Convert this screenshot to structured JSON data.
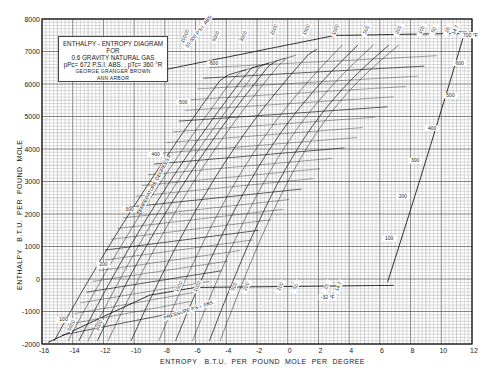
{
  "chart_data": {
    "type": "line",
    "subtitle": "pPc = 672 P.S.I. ABS. , pTc = 360 °R",
    "author": "GEORGE GRANGER BROWN",
    "institution": "ANN ARBOR",
    "xlabel": "ENTROPY   B.T.U.  PER  POUND  MOLE  PER  DEGREE",
    "ylabel": "ENTHALPY   B.T.U.  PER  POUND  MOLE",
    "xlim": [
      -16,
      12
    ],
    "ylim": [
      -2000,
      8000
    ],
    "x_ticks": [
      -16,
      -14,
      -12,
      -10,
      -8,
      -6,
      -4,
      -2,
      0,
      2,
      4,
      6,
      8,
      10,
      12
    ],
    "x_tick_labels": [
      "-16",
      "-14",
      "-12",
      "-10",
      "-8",
      "-6",
      "-4",
      "-2",
      "0",
      "2",
      "4",
      "6",
      "8",
      "10",
      "12"
    ],
    "y_ticks": [
      8000,
      7000,
      6000,
      5000,
      4000,
      3000,
      2000,
      1000,
      0,
      -1000,
      -2000
    ],
    "y_tick_labels": [
      "8000",
      "7000",
      "6000",
      "5000",
      "4000",
      "3000",
      "2000",
      "1000",
      "0",
      "-1000",
      "-2000"
    ],
    "grid": true,
    "annotations": {
      "temperature_label": "TEMPERATURE DEGREES F.",
      "pressure_label": "PRESSURE P.S.I. ABS.",
      "top_pressure_label": "10,000 P.S.I. ABS.",
      "top_temp_label": "700 °F",
      "bottom_temp_label": "-32 °F"
    },
    "isotherms": {
      "label": "Temperature °F",
      "values": [
        -100,
        0,
        100,
        200,
        300,
        400,
        500,
        600,
        700
      ],
      "right_edge_labels": [
        {
          "value": "100",
          "x": 6.6,
          "y": 1200
        },
        {
          "value": "200",
          "x": 7.5,
          "y": 2500
        },
        {
          "value": "300",
          "x": 8.3,
          "y": 3600
        },
        {
          "value": "400",
          "x": 9.4,
          "y": 4600
        },
        {
          "value": "500",
          "x": 10.6,
          "y": 5600
        },
        {
          "value": "600",
          "x": 11.2,
          "y": 6600
        },
        {
          "value": "700 °F",
          "x": 11.6,
          "y": 7500
        }
      ],
      "left_edge_labels": [
        {
          "value": "100",
          "x": -14.6,
          "y": -1300
        },
        {
          "value": "200",
          "x": -12.0,
          "y": 400
        },
        {
          "value": "300",
          "x": -10.3,
          "y": 2100
        },
        {
          "value": "400",
          "x": -8.6,
          "y": 3800
        },
        {
          "value": "500",
          "x": -6.8,
          "y": 5400
        },
        {
          "value": "600",
          "x": -4.8,
          "y": 6600
        }
      ]
    },
    "isobars": {
      "label": "Pressure P.S.I. ABS.",
      "top_labels": [
        "10000",
        "5000",
        "3000",
        "2000",
        "1500",
        "1000",
        "500",
        "200",
        "100",
        "50",
        "25",
        "14.7"
      ],
      "bottom_labels": [
        "5000",
        "3000",
        "1500",
        "1000",
        "500",
        "200",
        "100",
        "50",
        "25",
        "14.7"
      ]
    }
  },
  "title_box": {
    "line1": "ENTHALPY - ENTROPY  DIAGRAM",
    "line2": "FOR",
    "line3": "0.6  GRAVITY  NATURAL  GAS",
    "line4": "pPc= 672  P.S.I. ABS. ,  pTc= 360 °R",
    "line5": "GEORGE   GRANGER   BROWN",
    "line6": "ANN    ARBOR"
  },
  "colors": {
    "grid_fine": "#9a9a9a",
    "grid_major": "#555555",
    "curve": "#1a1a1a",
    "background": "#ffffff"
  }
}
